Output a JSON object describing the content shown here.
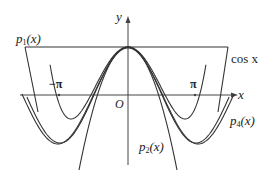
{
  "diagram": {
    "title": "",
    "axes": {
      "x_label": "x",
      "y_label": "y",
      "origin_label": "O",
      "ticks": [
        {
          "label": "−π",
          "value": -3.14159
        },
        {
          "label": "π",
          "value": 3.14159
        }
      ]
    },
    "curves": [
      {
        "name": "cos x",
        "label": "cos x"
      },
      {
        "name": "p1",
        "label_main": "p",
        "label_sub": "1",
        "label_arg": "(x)"
      },
      {
        "name": "p2",
        "label_main": "p",
        "label_sub": "2",
        "label_arg": "(x)"
      },
      {
        "name": "p4",
        "label_main": "p",
        "label_sub": "4",
        "label_arg": "(x)"
      }
    ],
    "stroke_color": "#333333",
    "background": "#ffffff"
  },
  "chart_data": {
    "type": "line",
    "title": "",
    "xlabel": "x",
    "ylabel": "y",
    "x_ticks": [
      "−π",
      "π"
    ],
    "series": [
      {
        "name": "cos x",
        "formula": "cos(x)"
      },
      {
        "name": "p1(x)",
        "formula": "1"
      },
      {
        "name": "p2(x)",
        "formula": "1 - x^2/2"
      },
      {
        "name": "p4(x)",
        "formula": "1 - x^2/2 + x^4/24"
      }
    ],
    "grid": false,
    "legend": "inline labels"
  }
}
